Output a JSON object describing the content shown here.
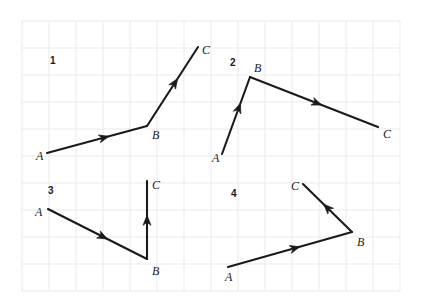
{
  "page": {
    "background_color": "#ffffff",
    "width": 426,
    "height": 301
  },
  "grid": {
    "line_color": "#e9e9ef",
    "cell_size": 27,
    "origin_x": 22,
    "origin_y": 21,
    "cols": 14,
    "rows": 10,
    "visible": true
  },
  "style": {
    "stroke_color": "#1a1a1a",
    "stroke_width": 2.1,
    "label_color": "#1a1a1a"
  },
  "figures": [
    {
      "number": "1",
      "number_pos": {
        "x": 50,
        "y": 56
      },
      "points": {
        "A": {
          "x": 47,
          "y": 153
        },
        "B": {
          "x": 147,
          "y": 126
        },
        "C": {
          "x": 198,
          "y": 47
        }
      },
      "labels": [
        {
          "text": "A",
          "x": 36,
          "y": 150
        },
        {
          "text": "B",
          "x": 152,
          "y": 129
        },
        {
          "text": "C",
          "x": 202,
          "y": 44
        }
      ],
      "arrows": [
        {
          "segment": "A-B",
          "t": 0.62
        },
        {
          "segment": "B-C",
          "t": 0.6
        }
      ]
    },
    {
      "number": "2",
      "number_pos": {
        "x": 230,
        "y": 58
      },
      "points": {
        "A": {
          "x": 222,
          "y": 154
        },
        "B": {
          "x": 250,
          "y": 77
        },
        "C": {
          "x": 378,
          "y": 127
        }
      },
      "labels": [
        {
          "text": "A",
          "x": 212,
          "y": 152
        },
        {
          "text": "B",
          "x": 254,
          "y": 62
        },
        {
          "text": "C",
          "x": 383,
          "y": 128
        }
      ],
      "arrows": [
        {
          "segment": "A-B",
          "t": 0.66
        },
        {
          "segment": "B-C",
          "t": 0.56
        }
      ]
    },
    {
      "number": "3",
      "number_pos": {
        "x": 48,
        "y": 186
      },
      "points": {
        "A": {
          "x": 48,
          "y": 209
        },
        "B": {
          "x": 147,
          "y": 259
        },
        "C": {
          "x": 147,
          "y": 181
        }
      },
      "labels": [
        {
          "text": "A",
          "x": 35,
          "y": 206
        },
        {
          "text": "B",
          "x": 152,
          "y": 265
        },
        {
          "text": "C",
          "x": 152,
          "y": 179
        }
      ],
      "arrows": [
        {
          "segment": "A-B",
          "t": 0.6
        },
        {
          "segment": "B-C",
          "t": 0.56
        }
      ]
    },
    {
      "number": "4",
      "number_pos": {
        "x": 231,
        "y": 189
      },
      "points": {
        "A": {
          "x": 228,
          "y": 267
        },
        "B": {
          "x": 352,
          "y": 232
        },
        "C": {
          "x": 303,
          "y": 184
        }
      },
      "labels": [
        {
          "text": "A",
          "x": 225,
          "y": 271
        },
        {
          "text": "B",
          "x": 357,
          "y": 236
        },
        {
          "text": "C",
          "x": 291,
          "y": 180
        }
      ],
      "arrows": [
        {
          "segment": "A-B",
          "t": 0.58
        },
        {
          "segment": "B-C",
          "t": 0.58
        }
      ]
    }
  ]
}
